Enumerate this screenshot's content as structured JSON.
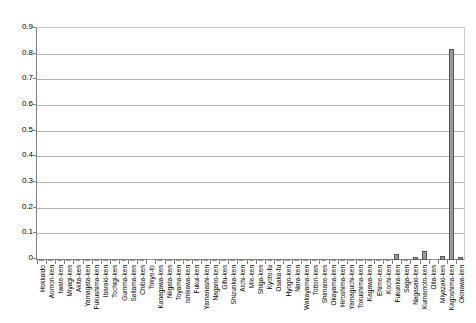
{
  "chart_data": {
    "type": "bar",
    "title": "",
    "subtitle": "",
    "xlabel": "",
    "ylabel": "",
    "ylim": [
      0,
      0.9
    ],
    "grid": true,
    "legend": false,
    "y_ticks": [
      "0",
      "0.1",
      "0.2",
      "0.3",
      "0.4",
      "0.5",
      "0.6",
      "0.7",
      "0.8",
      "0.9"
    ],
    "y_tick_values": [
      0,
      0.1,
      0.2,
      0.3,
      0.4,
      0.5,
      0.6,
      0.7,
      0.8,
      0.9
    ],
    "categories": [
      "Hokkaido",
      "Aomori-ken",
      "Iwate-ken",
      "Miyagi-ken",
      "Akita-ken",
      "Yamagata-ken",
      "Fukushima-ken",
      "Ibaraki-ken",
      "Tochigi-ken",
      "Gumma-ken",
      "Saitama-ken",
      "Chiba-ken",
      "Tokyo-to",
      "Kanagawa-ken",
      "Niigata-ken",
      "Toyama-ken",
      "Ishikawa-ken",
      "Fukui-ken",
      "Yamanashi-ken",
      "Nagano-ken",
      "Gifu-ken",
      "Shizuoka-ken",
      "Aichi-ken",
      "Mie-ken",
      "Shiga-ken",
      "Kyoto-fu",
      "Osaka-fu",
      "Hyogo-ken",
      "Nara-ken",
      "Wakayama-ken",
      "Tottori-ken",
      "Shimane-ken",
      "Okayama-ken",
      "Hiroshima-ken",
      "Yamaguchi-ken",
      "Tokushima-ken",
      "Kagawa-ken",
      "Ehime-ken",
      "Kochi-ken",
      "Fukuoka-ken",
      "Saga-ken",
      "Nagasaki-ken",
      "Kumamoto-ken",
      "Oita-ken",
      "Miyazaki-ken",
      "Kagoshima-ken",
      "Okinawa-ken"
    ],
    "values": [
      0.002,
      0.001,
      0.001,
      0.001,
      0.001,
      0.001,
      0.001,
      0.001,
      0.001,
      0.001,
      0.002,
      0.002,
      0.004,
      0.002,
      0.001,
      0.001,
      0.001,
      0.001,
      0.001,
      0.001,
      0.001,
      0.001,
      0.002,
      0.001,
      0.001,
      0.001,
      0.002,
      0.002,
      0.001,
      0.001,
      0.001,
      0.001,
      0.001,
      0.002,
      0.001,
      0.001,
      0.001,
      0.001,
      0.001,
      0.022,
      0.002,
      0.011,
      0.035,
      0.004,
      0.015,
      0.823,
      0.01
    ],
    "series_color": "#9a9a9a",
    "series_border_color": "#555555"
  }
}
